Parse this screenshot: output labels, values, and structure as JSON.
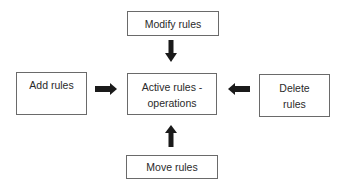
{
  "diagram": {
    "type": "hub-and-spoke flow diagram",
    "center": {
      "id": "active",
      "label_line1": "Active rules -",
      "label_line2": "operations"
    },
    "nodes": [
      {
        "id": "modify",
        "label": "Modify rules",
        "position": "top"
      },
      {
        "id": "add",
        "label": "Add rules",
        "position": "left"
      },
      {
        "id": "delete",
        "label_line1": "Delete",
        "label_line2": "rules",
        "position": "right"
      },
      {
        "id": "move",
        "label": "Move rules",
        "position": "bottom"
      }
    ],
    "edges": [
      {
        "from": "modify",
        "to": "active",
        "direction": "down"
      },
      {
        "from": "add",
        "to": "active",
        "direction": "right"
      },
      {
        "from": "delete",
        "to": "active",
        "direction": "left"
      },
      {
        "from": "move",
        "to": "active",
        "direction": "up"
      }
    ],
    "colors": {
      "border": "#6a6a6a",
      "arrow": "#1a1a1a",
      "text": "#2a2a2a",
      "background": "#ffffff"
    }
  }
}
